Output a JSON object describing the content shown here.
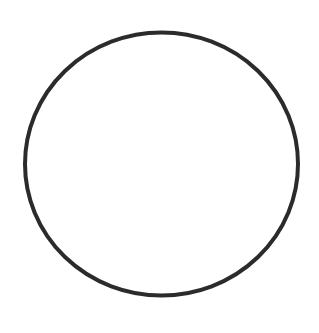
{
  "diagram": {
    "background": "#ffffff",
    "shapes": [
      {
        "type": "ellipse",
        "cx": 161.5,
        "cy": 164,
        "rx": 136.5,
        "ry": 131.5,
        "stroke": "#2b2b2b",
        "stroke_width": 4,
        "fill": "none"
      }
    ]
  }
}
